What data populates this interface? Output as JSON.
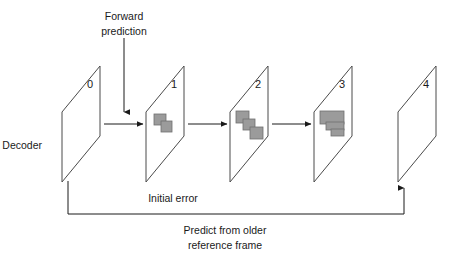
{
  "diagram": {
    "colors": {
      "frame_stroke": "#4a4a4a",
      "blob_fill": "#9b9b9b",
      "blob_stroke": "#6f6f6f",
      "arrow": "#1a1a1a",
      "background": "#ffffff",
      "text": "#1a1a1a"
    },
    "labels": {
      "forward_prediction_line1": "Forward",
      "forward_prediction_line2": "prediction",
      "decoder": "Decoder",
      "initial_error": "Initial error",
      "feedback_line1": "Predict from older",
      "feedback_line2": "reference frame"
    },
    "frames": [
      {
        "number": "0",
        "x": 62,
        "label_x": 90,
        "label_y": 85,
        "error_blocks": []
      },
      {
        "number": "1",
        "x": 146,
        "label_x": 174,
        "label_y": 85,
        "error_blocks": [
          {
            "x": 154,
            "y": 114,
            "w": 12,
            "h": 11
          },
          {
            "x": 161,
            "y": 121,
            "w": 11,
            "h": 11
          }
        ]
      },
      {
        "number": "2",
        "x": 230,
        "label_x": 258,
        "label_y": 85,
        "error_blocks": [
          {
            "x": 236,
            "y": 111,
            "w": 13,
            "h": 12
          },
          {
            "x": 243,
            "y": 119,
            "w": 12,
            "h": 11
          },
          {
            "x": 250,
            "y": 127,
            "w": 13,
            "h": 12
          }
        ]
      },
      {
        "number": "3",
        "x": 314,
        "label_x": 342,
        "label_y": 85,
        "error_blocks": [
          {
            "x": 320,
            "y": 111,
            "w": 24,
            "h": 13
          },
          {
            "x": 326,
            "y": 122,
            "w": 18,
            "h": 8
          },
          {
            "x": 331,
            "y": 129,
            "w": 13,
            "h": 7
          }
        ]
      },
      {
        "number": "4",
        "x": 398,
        "label_x": 426,
        "label_y": 85,
        "error_blocks": []
      }
    ],
    "arrows": [
      {
        "name": "decoder-to-frame1",
        "from_x": 104,
        "to_x": 143,
        "y": 124
      },
      {
        "name": "frame1-to-frame2",
        "from_x": 188,
        "to_x": 227,
        "y": 124
      },
      {
        "name": "frame2-to-frame3",
        "from_x": 272,
        "to_x": 311,
        "y": 124
      },
      {
        "name": "forward-prediction-down",
        "x": 124,
        "from_y": 38,
        "to_y": 112
      }
    ],
    "feedback_path": {
      "name": "predict-from-older-reference-frame",
      "start_x": 68,
      "start_y": 181,
      "bottom_y": 214,
      "end_x": 404,
      "end_y": 188
    }
  }
}
